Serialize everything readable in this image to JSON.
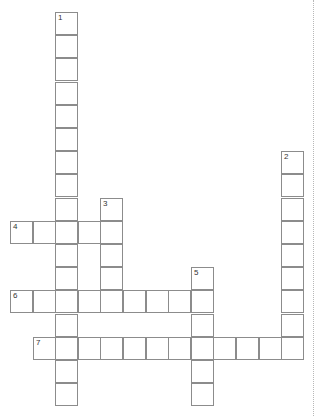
{
  "puzzle": {
    "type": "crossword",
    "rows": 17,
    "cols": 13,
    "grid_origin": {
      "x": 10,
      "y": 12
    },
    "cell_pitch": {
      "x": 22.6,
      "y": 23.2
    },
    "words": [
      {
        "number": "1",
        "direction": "down",
        "row": 0,
        "col": 2,
        "length": 17
      },
      {
        "number": "2",
        "direction": "down",
        "row": 6,
        "col": 12,
        "length": 9
      },
      {
        "number": "3",
        "direction": "down",
        "row": 8,
        "col": 4,
        "length": 5
      },
      {
        "number": "4",
        "direction": "across",
        "row": 9,
        "col": 0,
        "length": 5
      },
      {
        "number": "5",
        "direction": "down",
        "row": 11,
        "col": 8,
        "length": 6
      },
      {
        "number": "6",
        "direction": "across",
        "row": 12,
        "col": 0,
        "length": 9
      },
      {
        "number": "7",
        "direction": "across",
        "row": 14,
        "col": 1,
        "length": 12
      }
    ]
  },
  "colors": {
    "cell_border": "#8c8c8c",
    "background": "#ffffff",
    "divider": "#b8b8b8"
  }
}
